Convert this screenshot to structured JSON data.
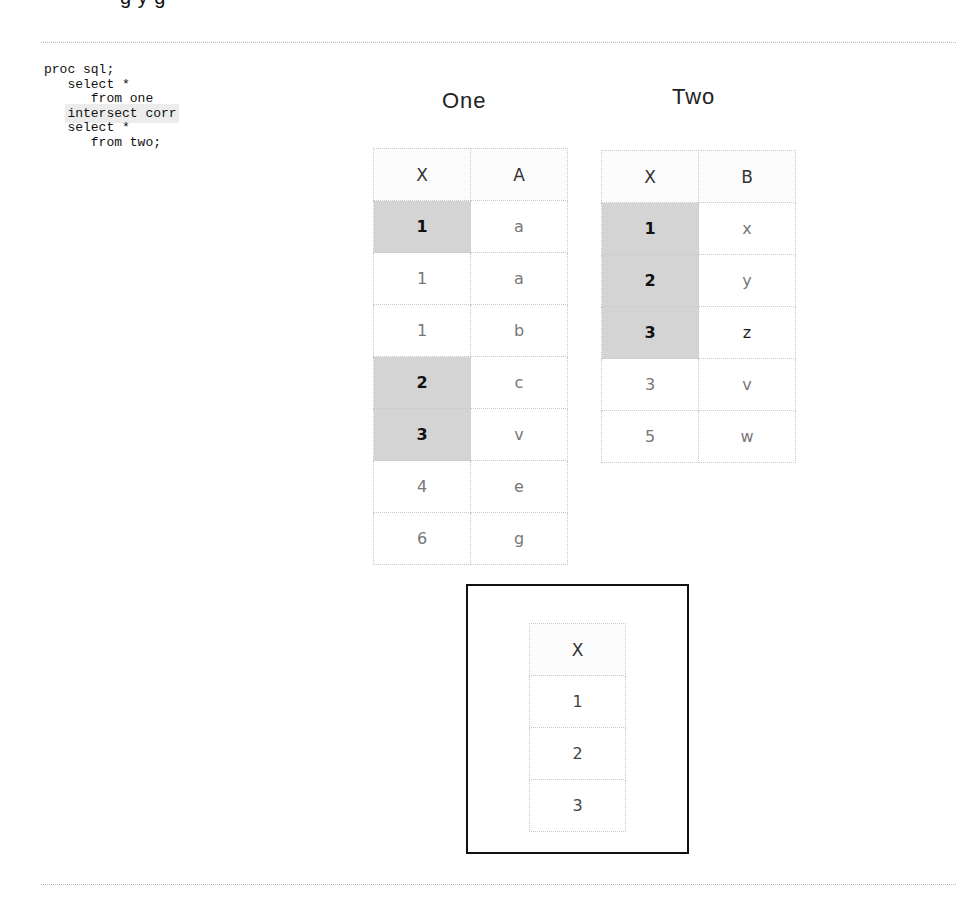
{
  "heading_fragment": "g                    y  g",
  "code": {
    "lines": [
      {
        "indent": "",
        "text": "proc sql;",
        "highlight": false
      },
      {
        "indent": "   ",
        "text": "select *",
        "highlight": false
      },
      {
        "indent": "      ",
        "text": "from one",
        "highlight": false
      },
      {
        "indent": "   ",
        "text": "intersect corr",
        "highlight": true
      },
      {
        "indent": "   ",
        "text": "select *",
        "highlight": false
      },
      {
        "indent": "      ",
        "text": "from two;",
        "highlight": false
      }
    ]
  },
  "tables": {
    "one": {
      "title": "One",
      "columns": [
        "X",
        "A"
      ],
      "rows": [
        {
          "x": "1",
          "v": "a",
          "match": true
        },
        {
          "x": "1",
          "v": "a",
          "match": false
        },
        {
          "x": "1",
          "v": "b",
          "match": false
        },
        {
          "x": "2",
          "v": "c",
          "match": true
        },
        {
          "x": "3",
          "v": "v",
          "match": true
        },
        {
          "x": "4",
          "v": "e",
          "match": false
        },
        {
          "x": "6",
          "v": "g",
          "match": false
        }
      ]
    },
    "two": {
      "title": "Two",
      "columns": [
        "X",
        "B"
      ],
      "rows": [
        {
          "x": "1",
          "v": "x",
          "match": true
        },
        {
          "x": "2",
          "v": "y",
          "match": true
        },
        {
          "x": "3",
          "v": "z",
          "match": true
        },
        {
          "x": "3",
          "v": "v",
          "match": false
        },
        {
          "x": "5",
          "v": "w",
          "match": false
        }
      ]
    },
    "result": {
      "columns": [
        "X"
      ],
      "rows": [
        "1",
        "2",
        "3"
      ]
    }
  },
  "colors": {
    "match_highlight": "#d4d4d4",
    "code_highlight": "#ececec",
    "grid_border": "#c8c8c8",
    "result_border": "#111111"
  }
}
